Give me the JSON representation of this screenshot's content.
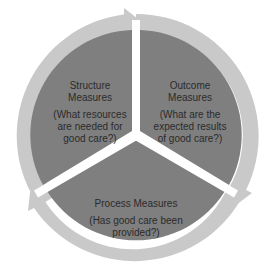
{
  "diagram": {
    "type": "cycle",
    "colors": {
      "sector_fill": "#7f7f7f",
      "ring_fill": "#c9c9c9",
      "divider": "#ffffff",
      "text": "#2b2b2b"
    },
    "segments": [
      {
        "id": "structure",
        "title": "Structure Measures",
        "title_lines": [
          "Structure",
          "Measures"
        ],
        "question": "(What resources are needed for good care?)",
        "question_lines": [
          "(What resources",
          "are needed for",
          "good care?)"
        ]
      },
      {
        "id": "outcome",
        "title": "Outcome Measures",
        "title_lines": [
          "Outcome",
          "Measures"
        ],
        "question": "(What are the expected results of good care?)",
        "question_lines": [
          "(What are the",
          "expected results",
          "of good care?)"
        ]
      },
      {
        "id": "process",
        "title": "Process Measures",
        "title_lines": [
          "Process Measures"
        ],
        "question": "(Has good care been provided?)",
        "question_lines": [
          "(Has good care been",
          "provided?)"
        ]
      }
    ],
    "flow": [
      "structure",
      "outcome",
      "process",
      "structure"
    ]
  }
}
